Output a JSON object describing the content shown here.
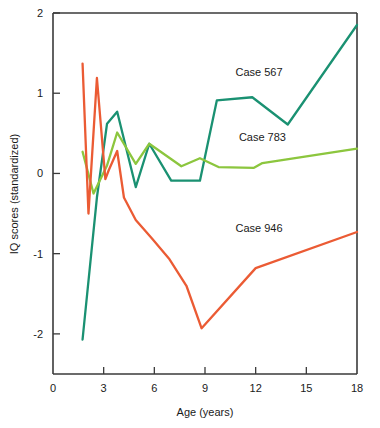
{
  "chart_data": {
    "type": "line",
    "title": "",
    "xlabel": "Age (years)",
    "ylabel": "IQ scores (standardized)",
    "xlim": [
      0,
      18
    ],
    "ylim": [
      -2.5,
      2
    ],
    "xticks": [
      0,
      3,
      6,
      9,
      12,
      15,
      18
    ],
    "xticklabels": [
      "0",
      "3",
      "6",
      "9",
      "12",
      "15",
      "18"
    ],
    "yticks": [
      -2,
      -1,
      0,
      1,
      2
    ],
    "yticklabels": [
      "-2",
      "-1",
      "0",
      "1",
      "2"
    ],
    "grid": false,
    "legend_position": "inline-annotations",
    "series": [
      {
        "name": "Case 567",
        "color": "#1a9172",
        "label_text": "Case 567",
        "label_x": 12.2,
        "label_y": 1.22,
        "points": [
          [
            1.75,
            -2.07
          ],
          [
            2.6,
            -0.3
          ],
          [
            3.2,
            0.62
          ],
          [
            3.8,
            0.77
          ],
          [
            4.9,
            -0.17
          ],
          [
            5.7,
            0.37
          ],
          [
            7.0,
            -0.09
          ],
          [
            8.7,
            -0.09
          ],
          [
            9.7,
            0.91
          ],
          [
            11.8,
            0.95
          ],
          [
            13.9,
            0.61
          ],
          [
            18.0,
            1.85
          ]
        ]
      },
      {
        "name": "Case 783",
        "color": "#8cc63e",
        "label_text": "Case 783",
        "label_x": 12.4,
        "label_y": 0.4,
        "points": [
          [
            1.75,
            0.27
          ],
          [
            2.4,
            -0.25
          ],
          [
            3.2,
            0.1
          ],
          [
            3.8,
            0.51
          ],
          [
            4.9,
            0.12
          ],
          [
            5.7,
            0.37
          ],
          [
            7.6,
            0.09
          ],
          [
            8.7,
            0.19
          ],
          [
            9.8,
            0.08
          ],
          [
            11.9,
            0.07
          ],
          [
            12.4,
            0.13
          ],
          [
            18.0,
            0.31
          ]
        ]
      },
      {
        "name": "Case 946",
        "color": "#eb5b34",
        "label_text": "Case 946",
        "label_x": 12.2,
        "label_y": -0.73,
        "points": [
          [
            1.75,
            1.37
          ],
          [
            2.1,
            -0.5
          ],
          [
            2.6,
            1.19
          ],
          [
            3.1,
            -0.07
          ],
          [
            3.3,
            0.04
          ],
          [
            3.8,
            0.28
          ],
          [
            4.2,
            -0.3
          ],
          [
            4.9,
            -0.58
          ],
          [
            5.9,
            -0.82
          ],
          [
            6.9,
            -1.07
          ],
          [
            7.9,
            -1.4
          ],
          [
            8.8,
            -1.93
          ],
          [
            12.0,
            -1.18
          ],
          [
            18.0,
            -0.73
          ]
        ]
      }
    ]
  }
}
